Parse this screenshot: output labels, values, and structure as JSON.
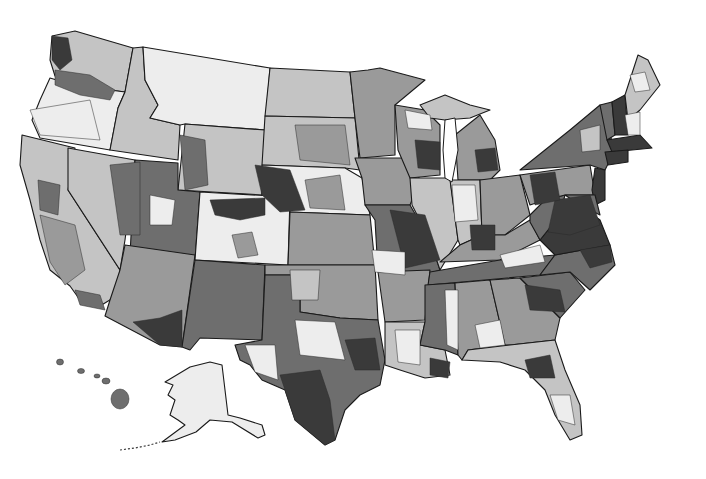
{
  "map": {
    "type": "choropleth",
    "subject": "United States regions (grayscale shaded)",
    "legend": null,
    "title": null,
    "classes": [
      {
        "id": 0,
        "color": "#ededed"
      },
      {
        "id": 1,
        "color": "#c4c4c4"
      },
      {
        "id": 2,
        "color": "#9a9a9a"
      },
      {
        "id": 3,
        "color": "#6e6e6e"
      },
      {
        "id": 4,
        "color": "#3a3a3a"
      }
    ],
    "insets": [
      "Alaska",
      "Hawaii"
    ]
  }
}
